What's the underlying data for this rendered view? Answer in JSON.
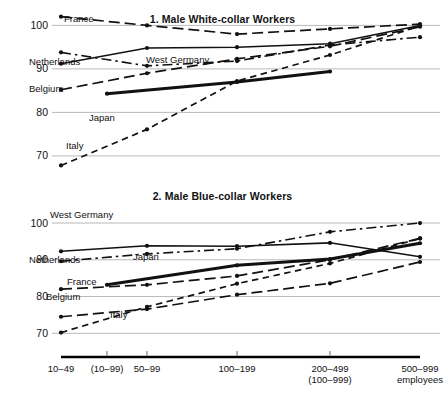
{
  "figure": {
    "background": "#ffffff",
    "line_color": "#111111",
    "gridline_color": "#b9b9b9"
  },
  "axis": {
    "tick_labels": [
      {
        "line1": "10–49",
        "line2": ""
      },
      {
        "line1": "(10–99)",
        "line2": ""
      },
      {
        "line1": "50–99",
        "line2": ""
      },
      {
        "line1": "100–199",
        "line2": ""
      },
      {
        "line1": "200–499",
        "line2": "(100–999)"
      },
      {
        "line1": "500–999",
        "line2": "employees"
      }
    ]
  },
  "chart_data": [
    {
      "type": "line",
      "title": "1. Male White-collar Workers",
      "xlabel": "",
      "ylabel": "",
      "ylim": [
        64,
        104
      ],
      "yticks": [
        70,
        80,
        90,
        100
      ],
      "ytick_labels": [
        "70",
        "90",
        "80",
        "100"
      ],
      "grid": true,
      "legend": "inline-labels",
      "categories": [
        "10–49",
        "(10–99)",
        "50–99",
        "100–199",
        "200–499",
        "500–999"
      ],
      "series": [
        {
          "name": "France",
          "style": "long-dash",
          "x": [
            0,
            2,
            3,
            4,
            5
          ],
          "values": [
            102.0,
            100.0,
            98.0,
            99.2,
            100.3
          ]
        },
        {
          "name": "Netherlands",
          "style": "dash-dot",
          "x": [
            0,
            2,
            3,
            4,
            5
          ],
          "values": [
            93.8,
            90.7,
            91.8,
            95.5,
            97.3
          ]
        },
        {
          "name": "West Germany",
          "style": "solid-thin",
          "x": [
            0,
            2,
            3,
            4,
            5
          ],
          "values": [
            91.2,
            94.8,
            95.0,
            95.8,
            100.0
          ]
        },
        {
          "name": "Belgium",
          "style": "long-dash",
          "x": [
            0,
            2,
            3,
            4,
            5
          ],
          "values": [
            85.2,
            89.0,
            92.3,
            95.2,
            99.7
          ]
        },
        {
          "name": "Japan",
          "style": "solid-thick",
          "x": [
            1,
            3,
            4
          ],
          "values": [
            84.3,
            87.0,
            89.4
          ]
        },
        {
          "name": "Italy",
          "style": "short-dash",
          "x": [
            0,
            2,
            3,
            4,
            5
          ],
          "values": [
            67.8,
            76.1,
            87.2,
            93.2,
            99.9
          ]
        }
      ],
      "series_label_positions": [
        {
          "name": "France",
          "x_px": 64,
          "y_px": 14
        },
        {
          "name": "Netherlands",
          "x_px": 29,
          "y_px": 57
        },
        {
          "name": "West Germany",
          "x_px": 146,
          "y_px": 55
        },
        {
          "name": "Belgium",
          "x_px": 29,
          "y_px": 84
        },
        {
          "name": "Japan",
          "x_px": 89,
          "y_px": 113
        },
        {
          "name": "Italy",
          "x_px": 66,
          "y_px": 141
        }
      ]
    },
    {
      "type": "line",
      "title": "2. Male Blue-collar Workers",
      "xlabel": "",
      "ylabel": "",
      "ylim": [
        66,
        103
      ],
      "yticks": [
        70,
        80,
        90,
        100
      ],
      "ytick_labels": [
        "70",
        "80",
        "90",
        "100"
      ],
      "grid": true,
      "legend": "inline-labels",
      "categories": [
        "10–49",
        "(10–99)",
        "50–99",
        "100–199",
        "200–499",
        "500–999"
      ],
      "series": [
        {
          "name": "West Germany",
          "style": "solid-thin",
          "x": [
            0,
            2,
            3,
            4,
            5
          ],
          "values": [
            92.3,
            93.8,
            93.7,
            94.6,
            90.8
          ]
        },
        {
          "name": "Netherlands",
          "style": "dash-dot",
          "x": [
            0,
            2,
            3,
            4,
            5
          ],
          "values": [
            89.6,
            91.6,
            93.0,
            97.6,
            100.0
          ]
        },
        {
          "name": "France",
          "style": "long-dash",
          "x": [
            0,
            2,
            3,
            4,
            5
          ],
          "values": [
            82.0,
            83.2,
            85.6,
            90.0,
            95.8
          ]
        },
        {
          "name": "Japan",
          "style": "solid-thick",
          "x": [
            1,
            3,
            4,
            5
          ],
          "values": [
            83.2,
            88.5,
            90.2,
            94.5
          ]
        },
        {
          "name": "Belgium",
          "style": "long-dash",
          "x": [
            0,
            2,
            3,
            4,
            5
          ],
          "values": [
            74.5,
            76.6,
            80.5,
            83.6,
            89.4
          ]
        },
        {
          "name": "Italy",
          "style": "short-dash",
          "x": [
            0,
            2,
            3,
            4,
            5
          ],
          "values": [
            70.2,
            77.2,
            83.5,
            89.0,
            95.8
          ]
        }
      ],
      "series_label_positions": [
        {
          "name": "West Germany",
          "x_px": 50,
          "y_px": 24
        },
        {
          "name": "Netherlands",
          "x_px": 29,
          "y_px": 69
        },
        {
          "name": "Japan",
          "x_px": 133,
          "y_px": 66
        },
        {
          "name": "France",
          "x_px": 67,
          "y_px": 91
        },
        {
          "name": "Belgium",
          "x_px": 46,
          "y_px": 106
        },
        {
          "name": "Italy",
          "x_px": 110,
          "y_px": 124
        }
      ]
    }
  ]
}
